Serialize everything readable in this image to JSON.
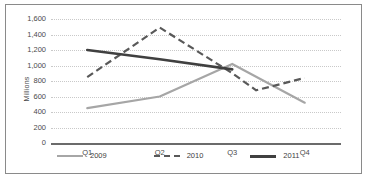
{
  "chart_data": {
    "type": "line",
    "title": "",
    "xlabel": "",
    "ylabel": "Millions",
    "categories": [
      "Q1",
      "Q2",
      "Q3",
      "Q4"
    ],
    "ylim": [
      0,
      1600
    ],
    "ytick_labels": [
      "1,600",
      "1,400",
      "1,200",
      "1,000",
      "800",
      "600",
      "400",
      "200",
      "0"
    ],
    "ytick_values": [
      1600,
      1400,
      1200,
      1000,
      800,
      600,
      400,
      200,
      0
    ],
    "grid": true,
    "legend_position": "bottom",
    "series": [
      {
        "name": "2009",
        "color": "#a6a6a6",
        "style": "solid",
        "values": [
          450,
          600,
          1020,
          520
        ]
      },
      {
        "name": "2010",
        "color": "#595959",
        "style": "dashed",
        "values": [
          850,
          1490,
          900,
          840
        ],
        "note": "dips to about 680 between Q3 and Q4 before rising"
      },
      {
        "name": "2011",
        "color": "#404040",
        "style": "solid",
        "values": [
          1200,
          1080,
          950,
          null
        ],
        "note": "series ends at Q3"
      }
    ]
  },
  "legend": {
    "items": [
      {
        "label": "2009"
      },
      {
        "label": "2010"
      },
      {
        "label": "2011"
      }
    ]
  }
}
